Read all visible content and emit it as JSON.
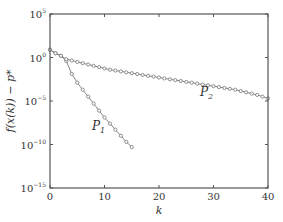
{
  "chart_data": {
    "type": "line",
    "title": "",
    "xlabel": "k",
    "ylabel": "f(x^(k)) − p*",
    "xlim": [
      0,
      40
    ],
    "ylim_log10": [
      -15,
      5
    ],
    "yscale": "log",
    "grid": false,
    "legend": "inline labels",
    "x_ticks": [
      0,
      10,
      20,
      30,
      40
    ],
    "y_ticks": [
      "10^5",
      "10^0",
      "10^-5",
      "10^-10",
      "10^-15"
    ],
    "series": [
      {
        "name": "P1",
        "x": [
          0,
          1,
          2,
          3,
          4,
          5,
          6,
          7,
          8,
          9,
          10,
          11,
          12,
          13,
          14,
          15
        ],
        "log10_y": [
          0.9,
          0.5,
          0.2,
          -0.4,
          -1.9,
          -2.9,
          -3.7,
          -4.5,
          -5.3,
          -6.1,
          -6.9,
          -7.6,
          -8.3,
          -9.0,
          -9.7,
          -10.3
        ]
      },
      {
        "name": "P2",
        "x": [
          0,
          1,
          2,
          3,
          4,
          5,
          6,
          7,
          8,
          9,
          10,
          11,
          12,
          13,
          14,
          15,
          16,
          17,
          18,
          19,
          20,
          21,
          22,
          23,
          24,
          25,
          26,
          27,
          28,
          29,
          30,
          31,
          32,
          33,
          34,
          35,
          36,
          37,
          38,
          39,
          40
        ],
        "log10_y": [
          0.9,
          0.5,
          0.2,
          -0.2,
          -0.35,
          -0.5,
          -0.65,
          -0.8,
          -0.95,
          -1.1,
          -1.25,
          -1.4,
          -1.5,
          -1.6,
          -1.7,
          -1.8,
          -1.9,
          -2.0,
          -2.1,
          -2.2,
          -2.3,
          -2.4,
          -2.5,
          -2.6,
          -2.7,
          -2.8,
          -2.9,
          -3.0,
          -3.1,
          -3.2,
          -3.3,
          -3.4,
          -3.5,
          -3.6,
          -3.7,
          -3.85,
          -4.0,
          -4.15,
          -4.3,
          -4.5,
          -4.7
        ]
      }
    ]
  },
  "labels": {
    "y_base": "10",
    "y_exps": [
      "5",
      "0",
      "−5",
      "−10",
      "−15"
    ],
    "x_ticks": [
      "0",
      "10",
      "20",
      "30",
      "40"
    ],
    "xlabel": "k",
    "ylabel": "f(x(k)) − p*",
    "p1": "P",
    "p1_sub": "1",
    "p2": "P",
    "p2_sub": "2"
  }
}
